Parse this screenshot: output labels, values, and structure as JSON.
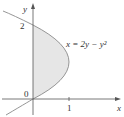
{
  "figure": {
    "equation": "x = 2y − y²",
    "axes": {
      "x_label": "x",
      "y_label": "y",
      "origin_label": "0",
      "x_ticks": [
        "1"
      ],
      "y_ticks": [
        "2"
      ]
    },
    "region": "area between y-axis and curve for 0 ≤ y ≤ 2",
    "colors": {
      "curve": "#8a8a8a",
      "axes": "#555555",
      "shade": "#e6e6e6"
    }
  }
}
